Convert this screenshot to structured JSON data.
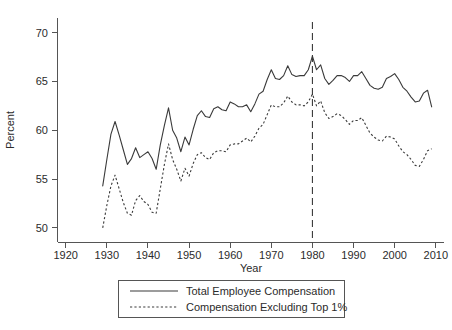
{
  "chart_data": {
    "type": "line",
    "title": "",
    "xlabel": "Year",
    "ylabel": "Percent",
    "xlim": [
      1918,
      2012
    ],
    "ylim": [
      48.5,
      71.5
    ],
    "xticks": [
      1920,
      1930,
      1940,
      1950,
      1960,
      1970,
      1980,
      1990,
      2000,
      2010
    ],
    "xtick_labels": [
      "1920",
      "1930",
      "1940",
      "1950",
      "1960",
      "1970",
      "1980",
      "1990",
      "2000",
      "2010"
    ],
    "yticks": [
      50,
      55,
      60,
      65,
      70
    ],
    "ytick_labels": [
      "50",
      "55",
      "60",
      "65",
      "70"
    ],
    "grid": false,
    "legend_position": "below-axes",
    "annotations": [
      {
        "type": "vertical-line",
        "x": 1980,
        "style": "dashed",
        "label": ""
      }
    ],
    "series": [
      {
        "name": "Total Employee Compensation",
        "style": "solid",
        "x": [
          1929,
          1930,
          1931,
          1932,
          1933,
          1934,
          1935,
          1936,
          1937,
          1938,
          1939,
          1940,
          1941,
          1942,
          1943,
          1944,
          1945,
          1946,
          1947,
          1948,
          1949,
          1950,
          1951,
          1952,
          1953,
          1954,
          1955,
          1956,
          1957,
          1958,
          1959,
          1960,
          1961,
          1962,
          1963,
          1964,
          1965,
          1966,
          1967,
          1968,
          1969,
          1970,
          1971,
          1972,
          1973,
          1974,
          1975,
          1976,
          1977,
          1978,
          1979,
          1980,
          1981,
          1982,
          1983,
          1984,
          1985,
          1986,
          1987,
          1988,
          1989,
          1990,
          1991,
          1992,
          1993,
          1994,
          1995,
          1996,
          1997,
          1998,
          1999,
          2000,
          2001,
          2002,
          2003,
          2004,
          2005,
          2006,
          2007,
          2008,
          2009
        ],
        "values": [
          54.3,
          57.0,
          59.6,
          60.9,
          59.5,
          58.0,
          56.5,
          57.1,
          58.2,
          57.2,
          57.5,
          57.8,
          57.1,
          56.0,
          58.5,
          60.5,
          62.3,
          60.0,
          59.2,
          57.8,
          59.3,
          58.5,
          60.1,
          61.5,
          62.0,
          61.4,
          61.3,
          62.2,
          62.4,
          62.1,
          62.0,
          62.9,
          62.7,
          62.4,
          62.4,
          62.6,
          61.9,
          62.7,
          63.7,
          64.0,
          65.2,
          66.2,
          65.3,
          65.2,
          65.6,
          66.6,
          65.7,
          65.5,
          65.6,
          65.6,
          66.2,
          67.6,
          66.2,
          66.7,
          65.3,
          64.7,
          65.1,
          65.6,
          65.6,
          65.4,
          65.0,
          65.6,
          65.6,
          66.0,
          65.3,
          64.6,
          64.3,
          64.2,
          64.4,
          65.3,
          65.5,
          65.8,
          65.2,
          64.4,
          64.0,
          63.4,
          62.9,
          63.0,
          63.8,
          64.1,
          62.4
        ]
      },
      {
        "name": "Compensation Excluding Top 1%",
        "style": "dashed",
        "x": [
          1929,
          1930,
          1931,
          1932,
          1933,
          1934,
          1935,
          1936,
          1937,
          1938,
          1939,
          1940,
          1941,
          1942,
          1943,
          1944,
          1945,
          1946,
          1947,
          1948,
          1949,
          1950,
          1951,
          1952,
          1953,
          1954,
          1955,
          1956,
          1957,
          1958,
          1959,
          1960,
          1961,
          1962,
          1963,
          1964,
          1965,
          1966,
          1967,
          1968,
          1969,
          1970,
          1971,
          1972,
          1973,
          1974,
          1975,
          1976,
          1977,
          1978,
          1979,
          1980,
          1981,
          1982,
          1983,
          1984,
          1985,
          1986,
          1987,
          1988,
          1989,
          1990,
          1991,
          1992,
          1993,
          1994,
          1995,
          1996,
          1997,
          1998,
          1999,
          2000,
          2001,
          2002,
          2003,
          2004,
          2005,
          2006,
          2007,
          2008,
          2009
        ],
        "values": [
          50.0,
          52.3,
          54.3,
          55.4,
          54.0,
          52.6,
          51.5,
          51.3,
          52.8,
          53.3,
          52.7,
          52.4,
          51.6,
          51.5,
          54.0,
          56.5,
          58.6,
          57.0,
          56.0,
          54.8,
          56.1,
          55.3,
          56.6,
          57.5,
          57.7,
          57.2,
          57.0,
          57.7,
          57.9,
          57.9,
          57.8,
          58.5,
          58.6,
          58.6,
          58.9,
          59.2,
          58.8,
          59.4,
          60.2,
          60.6,
          61.6,
          62.6,
          62.4,
          62.4,
          62.8,
          63.5,
          62.9,
          62.6,
          62.6,
          62.5,
          62.9,
          63.7,
          62.5,
          63.0,
          61.8,
          61.2,
          61.4,
          61.7,
          61.5,
          61.1,
          60.6,
          61.0,
          61.0,
          61.3,
          60.5,
          59.7,
          59.3,
          59.0,
          58.9,
          59.4,
          59.3,
          59.1,
          58.4,
          57.8,
          57.5,
          57.0,
          56.4,
          56.3,
          57.0,
          57.9,
          58.1
        ]
      }
    ]
  },
  "legend": {
    "entries": [
      {
        "label": "Total Employee Compensation",
        "style": "solid"
      },
      {
        "label": "Compensation Excluding Top 1%",
        "style": "dashed"
      }
    ]
  },
  "colors": {
    "line": "#3a3a3a",
    "axis": "#555555",
    "text": "#2b2b2b",
    "background": "#ffffff"
  }
}
